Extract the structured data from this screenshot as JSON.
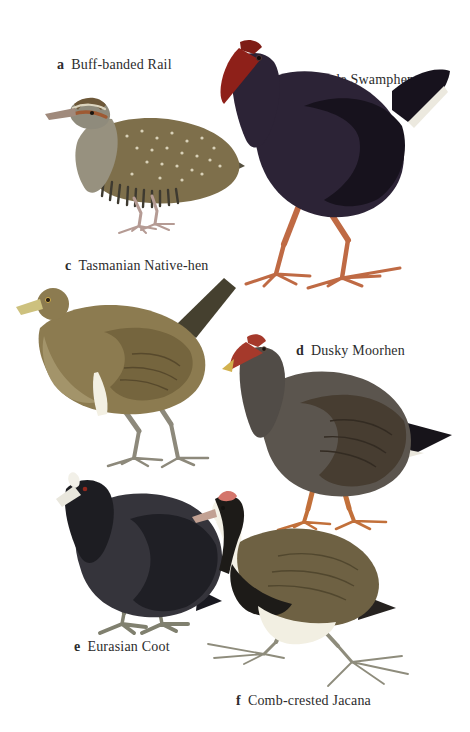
{
  "plate": {
    "background": "#ffffff",
    "label_color": "#2c2c2c",
    "figures": [
      {
        "letter": "a",
        "name": "Buff-banded Rail",
        "colors": {
          "body": "#7e6f4b",
          "wing": "#55503f",
          "accent": "#9e5a33",
          "legs": "#b59b94"
        }
      },
      {
        "letter": "b",
        "name": "Purple Swamphen",
        "colors": {
          "body": "#2c2336",
          "wing": "#17121d",
          "accent": "#8e2019",
          "legs": "#bf6a44"
        }
      },
      {
        "letter": "c",
        "name": "Tasmanian Native-hen",
        "colors": {
          "body": "#8c7b50",
          "wing": "#75653e",
          "accent": "#cdc17e",
          "legs": "#8d897b"
        }
      },
      {
        "letter": "d",
        "name": "Dusky Moorhen",
        "colors": {
          "body": "#5b554e",
          "wing": "#473d31",
          "accent": "#a5392b",
          "legs": "#c2703a"
        }
      },
      {
        "letter": "e",
        "name": "Eurasian Coot",
        "colors": {
          "body": "#35343b",
          "wing": "#1f1f25",
          "accent": "#f2f0e8",
          "legs": "#80806f"
        }
      },
      {
        "letter": "f",
        "name": "Comb-crested Jacana",
        "colors": {
          "body": "#6e6143",
          "wing": "#51472e",
          "accent": "#d4756b",
          "legs": "#8e8c7c"
        }
      }
    ]
  }
}
